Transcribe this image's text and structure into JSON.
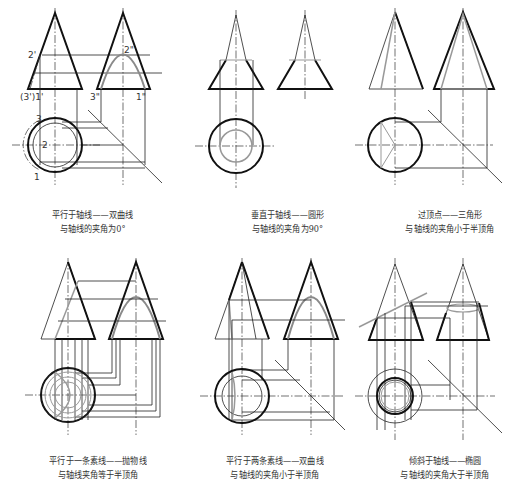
{
  "figure": {
    "panels": [
      {
        "id": "parallel-axis",
        "caption_line1": "平行于轴线——双曲线",
        "caption_line2": "与轴线的夹角为0°",
        "labels": [
          "2'",
          "(3')1'",
          "2\"",
          "3\"",
          "1\"",
          "3",
          "2",
          "1"
        ]
      },
      {
        "id": "perpendicular-axis",
        "caption_line1": "垂直于轴线——圆形",
        "caption_line2": "与轴线的夹角为90°"
      },
      {
        "id": "through-apex",
        "caption_line1": "过顶点——三角形",
        "caption_line2": "与轴线的夹角小于半顶角"
      },
      {
        "id": "parallel-one-element",
        "caption_line1": "平行于一条素线——抛物线",
        "caption_line2": "与轴线夹角等于半顶角"
      },
      {
        "id": "parallel-two-elements",
        "caption_line1": "平行于两条素线——双曲线",
        "caption_line2": "与轴线的夹角小于半顶角"
      },
      {
        "id": "oblique-axis",
        "caption_line1": "倾斜于轴线——椭圆",
        "caption_line2": "与轴线的夹角大于半顶角"
      }
    ],
    "labels": {
      "p1_2prime": "2'",
      "p1_31prime": "(3')1'",
      "p1_2dbl": "2\"",
      "p1_3dbl": "3\"",
      "p1_1dbl": "1\"",
      "p1_3": "3",
      "p1_2": "2",
      "p1_1": "1"
    },
    "colors": {
      "outline": "#111111",
      "section": "#8a8a8a",
      "background": "#ffffff"
    }
  }
}
